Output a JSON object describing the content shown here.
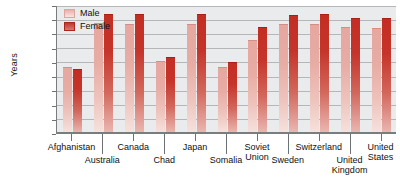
{
  "chart_data": {
    "type": "bar",
    "title": "",
    "xlabel": "",
    "ylabel": "Years",
    "ylim": [
      0,
      90
    ],
    "yticks": [
      0,
      10,
      20,
      30,
      40,
      50,
      60,
      70,
      80,
      90
    ],
    "grid": true,
    "legend_position": "top-left",
    "categories": [
      "Afghanistan",
      "Australia",
      "Canada",
      "Chad",
      "Japan",
      "Somalia",
      "Soviet Union",
      "Sweden",
      "Switzerland",
      "United Kingdom",
      "United States"
    ],
    "series": [
      {
        "name": "Male",
        "color": "#eab4ac",
        "values": [
          46,
          77,
          76,
          50,
          76,
          46,
          65,
          76,
          76,
          74,
          73
        ]
      },
      {
        "name": "Female",
        "color": "#c4342a",
        "values": [
          44,
          83,
          83,
          53,
          83,
          49,
          74,
          82,
          83,
          80,
          80
        ]
      }
    ]
  },
  "legend": {
    "items": [
      {
        "label": "Male",
        "color": "#eab4ac"
      },
      {
        "label": "Female",
        "color": "#c4342a"
      }
    ]
  },
  "axes": {
    "y_title": "Years",
    "y_tick_labels": [
      "90",
      "80",
      "70",
      "60",
      "50",
      "40",
      "30",
      "20",
      "10",
      "0"
    ],
    "x_tick_labels_upper": [
      "Afghanistan",
      "Canada",
      "Japan",
      "Soviet\nUnion",
      "Switzerland",
      "United\nStates"
    ],
    "x_tick_labels_lower": [
      "Australia",
      "Chad",
      "Somalia",
      "Sweden",
      "United Kingdom"
    ]
  },
  "colors": {
    "male_bar": "#eab4ac",
    "female_bar": "#c4342a",
    "plot_background": "#e9ebec",
    "gridline": "#b4b7b9",
    "axis": "#7a7d80",
    "text": "#111111"
  }
}
